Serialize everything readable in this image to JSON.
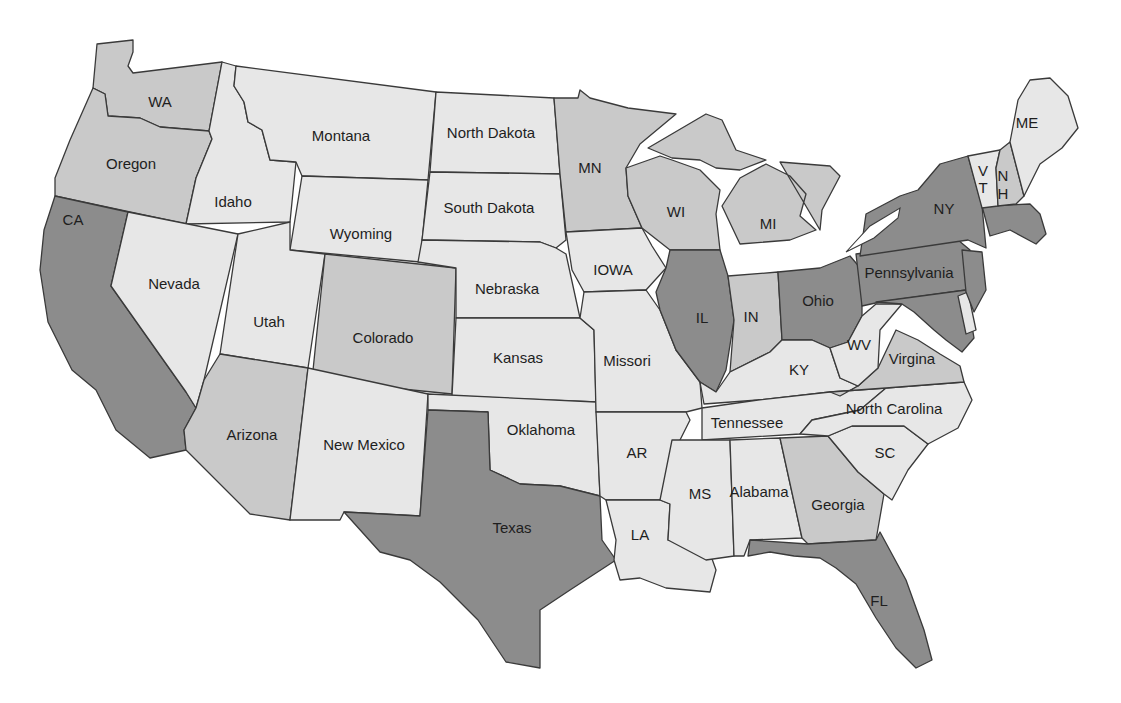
{
  "map": {
    "title": "",
    "legend": {
      "levels": [
        {
          "name": "high",
          "color": "#8c8c8c"
        },
        {
          "name": "medium",
          "color": "#c9c9c9"
        },
        {
          "name": "low",
          "color": "#e7e7e7"
        }
      ]
    },
    "states": {
      "WA": {
        "label": "WA",
        "shade": "medium"
      },
      "OR": {
        "label": "Oregon",
        "shade": "medium"
      },
      "CA": {
        "label": "CA",
        "shade": "high"
      },
      "ID": {
        "label": "Idaho",
        "shade": "low"
      },
      "NV": {
        "label": "Nevada",
        "shade": "low"
      },
      "MT": {
        "label": "Montana",
        "shade": "low"
      },
      "WY": {
        "label": "Wyoming",
        "shade": "low"
      },
      "UT": {
        "label": "Utah",
        "shade": "low"
      },
      "CO": {
        "label": "Colorado",
        "shade": "medium"
      },
      "AZ": {
        "label": "Arizona",
        "shade": "medium"
      },
      "NM": {
        "label": "New Mexico",
        "shade": "low"
      },
      "ND": {
        "label": "North Dakota",
        "shade": "low"
      },
      "SD": {
        "label": "South Dakota",
        "shade": "low"
      },
      "NE": {
        "label": "Nebraska",
        "shade": "low"
      },
      "KS": {
        "label": "Kansas",
        "shade": "low"
      },
      "OK": {
        "label": "Oklahoma",
        "shade": "low"
      },
      "TX": {
        "label": "Texas",
        "shade": "high"
      },
      "MN": {
        "label": "MN",
        "shade": "medium"
      },
      "IA": {
        "label": "IOWA",
        "shade": "low"
      },
      "MO": {
        "label": "Missori",
        "shade": "low"
      },
      "AR": {
        "label": "AR",
        "shade": "low"
      },
      "LA": {
        "label": "LA",
        "shade": "low"
      },
      "WI": {
        "label": "WI",
        "shade": "medium"
      },
      "IL": {
        "label": "IL",
        "shade": "high"
      },
      "MI": {
        "label": "MI",
        "shade": "medium"
      },
      "IN": {
        "label": "IN",
        "shade": "medium"
      },
      "OH": {
        "label": "Ohio",
        "shade": "high"
      },
      "KY": {
        "label": "KY",
        "shade": "low"
      },
      "TN": {
        "label": "Tennessee",
        "shade": "low"
      },
      "MS": {
        "label": "MS",
        "shade": "low"
      },
      "AL": {
        "label": "Alabama",
        "shade": "low"
      },
      "GA": {
        "label": "Georgia",
        "shade": "medium"
      },
      "FL": {
        "label": "FL",
        "shade": "high"
      },
      "SC": {
        "label": "SC",
        "shade": "low"
      },
      "NC": {
        "label": "North Carolina",
        "shade": "low"
      },
      "VA": {
        "label": "Virgina",
        "shade": "medium"
      },
      "WV": {
        "label": "WV",
        "shade": "low"
      },
      "PA": {
        "label": "Pennsylvania",
        "shade": "high"
      },
      "NY": {
        "label": "NY",
        "shade": "high"
      },
      "VT": {
        "label_line1": "V",
        "label_line2": "T",
        "shade": "low"
      },
      "NH": {
        "label_line1": "N",
        "label_line2": "H",
        "shade": "medium"
      },
      "ME": {
        "label": "ME",
        "shade": "low"
      },
      "MA": {
        "label": "",
        "shade": "high"
      },
      "NJ": {
        "label": "",
        "shade": "high"
      },
      "MD": {
        "label": "",
        "shade": "high"
      },
      "DE": {
        "label": "",
        "shade": "low"
      }
    }
  }
}
